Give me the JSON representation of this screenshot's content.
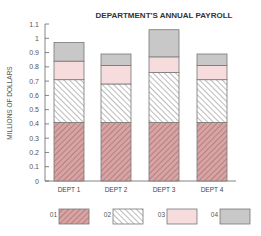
{
  "chart_data": {
    "type": "bar",
    "stacked": true,
    "title": "DEPARTMENT'S ANNUAL PAYROLL",
    "xlabel": "",
    "ylabel": "MILLIONS OF DOLLARS",
    "ylim": [
      0,
      1.1
    ],
    "yticks": [
      0,
      0.1,
      0.2,
      0.3,
      0.4,
      0.5,
      0.6,
      0.7,
      0.8,
      0.9,
      1,
      1.1
    ],
    "ytick_labels": [
      "0",
      "0.1",
      "0.2",
      "0.3",
      "0.4",
      "0.5",
      "0.6",
      "0.7",
      "0.8",
      "0.9",
      "1",
      "1.1"
    ],
    "grid": false,
    "legend_position": "bottom",
    "categories": [
      "DEPT 1",
      "DEPT 2",
      "DEPT 3",
      "DEPT 4"
    ],
    "series": [
      {
        "name": "01",
        "values": [
          0.41,
          0.41,
          0.41,
          0.41
        ],
        "fill": "#d9a3a3",
        "pattern": "hatch-forward",
        "stroke": "#7a4a4a"
      },
      {
        "name": "02",
        "values": [
          0.3,
          0.27,
          0.35,
          0.3
        ],
        "fill": "#ffffff",
        "pattern": "hatch-back",
        "stroke": "#555555"
      },
      {
        "name": "03",
        "values": [
          0.13,
          0.13,
          0.11,
          0.1
        ],
        "fill": "#f6dcdc",
        "pattern": "solid",
        "stroke": "#888888"
      },
      {
        "name": "04",
        "values": [
          0.13,
          0.08,
          0.19,
          0.08
        ],
        "fill": "#c8c8c8",
        "pattern": "solid",
        "stroke": "#888888"
      }
    ]
  }
}
